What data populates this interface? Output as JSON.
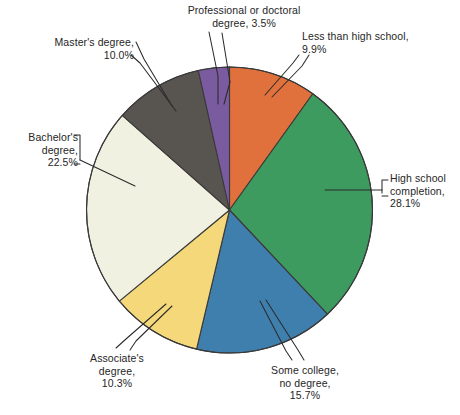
{
  "chart_data": {
    "type": "pie",
    "title": "",
    "subtitle": "",
    "xlabel": "",
    "ylabel": "",
    "legend_position": "none",
    "grid": false,
    "labels_outside": true,
    "unit": "%",
    "categories": [
      "Less than high school",
      "High school completion",
      "Some college, no degree",
      "Associate's degree",
      "Bachelor's degree",
      "Master's degree",
      "Professional or doctoral degree"
    ],
    "values": [
      9.9,
      28.1,
      15.7,
      10.3,
      22.5,
      10.0,
      3.5
    ],
    "colors": [
      "#e0713c",
      "#3e9b5f",
      "#3f7fad",
      "#f4d87a",
      "#f1f1e1",
      "#585550",
      "#7b5ba0"
    ],
    "slices": [
      {
        "id": "less-than-high-school",
        "label": "Less than high school,",
        "value_label": "9.9%",
        "value": 9.9,
        "color": "#e0713c",
        "start_deg": 0.0,
        "end_deg": 35.64
      },
      {
        "id": "high-school-completion",
        "label": "High school\ncompletion,",
        "value_label": "28.1%",
        "value": 28.1,
        "color": "#3e9b5f",
        "start_deg": 35.64,
        "end_deg": 136.8
      },
      {
        "id": "some-college-no-degree",
        "label": "Some college,\nno degree,",
        "value_label": "15.7%",
        "value": 15.7,
        "color": "#3f7fad",
        "start_deg": 136.8,
        "end_deg": 193.32
      },
      {
        "id": "associates-degree",
        "label": "Associate's\ndegree,",
        "value_label": "10.3%",
        "value": 10.3,
        "color": "#f4d87a",
        "start_deg": 193.32,
        "end_deg": 230.4
      },
      {
        "id": "bachelors-degree",
        "label": "Bachelor's\ndegree,",
        "value_label": "22.5%",
        "value": 22.5,
        "color": "#f1f1e1",
        "start_deg": 230.4,
        "end_deg": 311.4
      },
      {
        "id": "masters-degree",
        "label": "Master's degree,",
        "value_label": "10.0%",
        "value": 10.0,
        "color": "#585550",
        "start_deg": 311.4,
        "end_deg": 347.4
      },
      {
        "id": "professional-or-doctoral-degree",
        "label": "Professional or doctoral\ndegree,",
        "value_label": "3.5%",
        "value": 3.5,
        "color": "#7b5ba0",
        "start_deg": 347.4,
        "end_deg": 360.0
      }
    ]
  },
  "labels": {
    "professional": "Professional or doctoral\ndegree, 3.5%",
    "less_than_high_school": "Less than high school,\n9.9%",
    "masters": "Master's degree,\n10.0%",
    "bachelors": "Bachelor's\ndegree,\n22.5%",
    "high_school": "High school\ncompletion,\n28.1%",
    "associates": "Associate's\ndegree,\n10.3%",
    "some_college": "Some college,\nno degree,\n15.7%"
  },
  "style": {
    "outline": "#3a3a3a",
    "leader_line": "#2b2b2b",
    "background": "#ffffff",
    "text": "#262626"
  }
}
